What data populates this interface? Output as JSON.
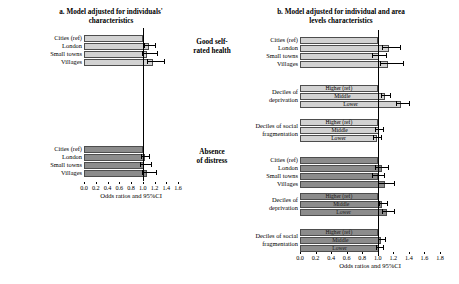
{
  "figure": {
    "center_labels": [
      {
        "line1": "Good self-",
        "line2": "rated health"
      },
      {
        "line1": "Absence",
        "line2": "of distress"
      }
    ],
    "colors": {
      "light_bar": "#d2d2d2",
      "dark_bar": "#8c8c8c",
      "bar_border": "#4d4d4d",
      "reference_line": "#000000"
    }
  },
  "chart_data": [
    {
      "type": "bar",
      "id": "panel-a",
      "title": "a. Model adjusted for individuals' characteristics",
      "title_lines": [
        "a. Model adjusted for individuals'",
        "characteristics"
      ],
      "orientation": "horizontal",
      "xlabel": "Odds ratios and 95%CI",
      "ylabel": "",
      "xlim": [
        0.0,
        1.6
      ],
      "xticks": [
        0.0,
        0.2,
        0.4,
        0.6,
        0.8,
        1.0,
        1.2,
        1.4,
        1.6
      ],
      "xticklabels": [
        "0.0",
        "0.2",
        "0.4",
        "0.6",
        "0.8",
        "1.0",
        "1.2",
        "1.4",
        "1.6"
      ],
      "reference_line": 1.0,
      "grid": false,
      "legend": "none",
      "groups": [
        {
          "outcome": "Good self-rated health",
          "style": "light",
          "block_label": "",
          "labels_inside_bars": false,
          "categories": [
            "Cities (ref)",
            "London",
            "Small towns",
            "Villages"
          ],
          "values": [
            1.0,
            1.1,
            1.07,
            1.18
          ],
          "ci_low": [
            1.0,
            1.02,
            0.99,
            1.08
          ],
          "ci_high": [
            1.0,
            1.23,
            1.26,
            1.38
          ]
        },
        {
          "outcome": "Absence of distress",
          "style": "dark",
          "block_label": "",
          "labels_inside_bars": false,
          "categories": [
            "Cities (ref)",
            "London",
            "Small towns",
            "Villages"
          ],
          "values": [
            1.0,
            1.04,
            1.02,
            1.07
          ],
          "ci_low": [
            1.0,
            0.97,
            0.95,
            0.98
          ],
          "ci_high": [
            1.0,
            1.12,
            1.16,
            1.25
          ]
        }
      ]
    },
    {
      "type": "bar",
      "id": "panel-b",
      "title": "b. Model adjusted for individual and area levels characteristics",
      "title_lines": [
        "b. Model adjusted for individual and area",
        "levels characteristics"
      ],
      "orientation": "horizontal",
      "xlabel": "Odds ratios and 95%CI",
      "ylabel": "",
      "xlim": [
        0.0,
        1.8
      ],
      "xticks": [
        0.0,
        0.2,
        0.4,
        0.6,
        0.8,
        1.0,
        1.2,
        1.4,
        1.6,
        1.8
      ],
      "xticklabels": [
        "0.0",
        "0.2",
        "0.4",
        "0.6",
        "0.8",
        "1.0",
        "1.2",
        "1.4",
        "1.6",
        "1.8"
      ],
      "reference_line": 1.0,
      "grid": false,
      "legend": "none",
      "groups": [
        {
          "outcome": "Good self-rated health",
          "style": "light",
          "block_label": "",
          "labels_inside_bars": false,
          "categories": [
            "Cities (ref)",
            "London",
            "Small towns",
            "Villages"
          ],
          "values": [
            1.0,
            1.14,
            1.02,
            1.13
          ],
          "ci_low": [
            1.0,
            1.05,
            0.92,
            1.03
          ],
          "ci_high": [
            1.0,
            1.3,
            1.12,
            1.34
          ]
        },
        {
          "outcome": "Good self-rated health",
          "style": "light",
          "block_label": "Deciles of deprivation",
          "block_label_lines": [
            "Deciles of",
            "deprivation"
          ],
          "labels_inside_bars": true,
          "categories": [
            "Higher (ref)",
            "Middle",
            "Lower"
          ],
          "values": [
            1.0,
            1.09,
            1.3
          ],
          "ci_low": [
            1.0,
            1.04,
            1.24
          ],
          "ci_high": [
            1.0,
            1.17,
            1.42
          ]
        },
        {
          "outcome": "Good self-rated health",
          "style": "light",
          "block_label": "Deciles of social fragmentation",
          "block_label_lines": [
            "Deciles of social",
            "fragmentation"
          ],
          "labels_inside_bars": true,
          "categories": [
            "Higher (ref)",
            "Middle",
            "Lower"
          ],
          "values": [
            1.0,
            1.02,
            0.99
          ],
          "ci_low": [
            1.0,
            0.96,
            0.94
          ],
          "ci_high": [
            1.0,
            1.08,
            1.06
          ]
        },
        {
          "outcome": "Absence of distress",
          "style": "dark",
          "block_label": "",
          "labels_inside_bars": false,
          "categories": [
            "Cities (ref)",
            "London",
            "Small towns",
            "Villages"
          ],
          "values": [
            1.0,
            1.05,
            1.0,
            1.09
          ],
          "ci_low": [
            1.0,
            0.97,
            0.92,
            1.0
          ],
          "ci_high": [
            1.0,
            1.14,
            1.09,
            1.22
          ]
        },
        {
          "outcome": "Absence of distress",
          "style": "dark",
          "block_label": "Deciles of deprivation",
          "block_label_lines": [
            "Deciles of",
            "deprivation"
          ],
          "labels_inside_bars": true,
          "categories": [
            "Higher (ref)",
            "Middle",
            "Lower"
          ],
          "values": [
            1.0,
            1.06,
            1.12
          ],
          "ci_low": [
            1.0,
            1.01,
            1.05
          ],
          "ci_high": [
            1.0,
            1.13,
            1.22
          ]
        },
        {
          "outcome": "Absence of distress",
          "style": "dark",
          "block_label": "Deciles of social fragmentation",
          "block_label_lines": [
            "Deciles of social",
            "fragmentation"
          ],
          "labels_inside_bars": true,
          "categories": [
            "Higher (ref)",
            "Middle",
            "Lower"
          ],
          "values": [
            1.0,
            1.04,
            1.02
          ],
          "ci_low": [
            1.0,
            1.0,
            0.98
          ],
          "ci_high": [
            1.0,
            1.1,
            1.08
          ]
        }
      ]
    }
  ]
}
